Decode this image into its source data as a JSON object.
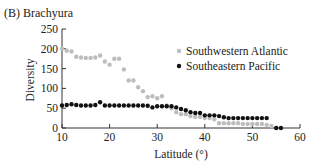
{
  "chart_data": {
    "type": "scatter",
    "title": "(B) Brachyura",
    "xlabel": "Latitude (°)",
    "ylabel": "Diversity",
    "xlim": [
      10,
      60
    ],
    "ylim": [
      0,
      250
    ],
    "xticks": [
      10,
      20,
      30,
      40,
      50,
      60
    ],
    "yticks": [
      0,
      50,
      100,
      150,
      200,
      250
    ],
    "grid": false,
    "legend_position": "upper right",
    "series": [
      {
        "name": "Southwestern Atlantic",
        "color": "#bdbdbd",
        "x": [
          10,
          11,
          12,
          13,
          14,
          15,
          16,
          17,
          18,
          19,
          20,
          21,
          22,
          23,
          24,
          25,
          26,
          27,
          28,
          29,
          30,
          31,
          32,
          33,
          34,
          35,
          36,
          37,
          38,
          39,
          40,
          41,
          42,
          43,
          44,
          45,
          46,
          47,
          48,
          49,
          50,
          51,
          52,
          53,
          54
        ],
        "y": [
          200,
          195,
          193,
          180,
          178,
          177,
          177,
          178,
          183,
          168,
          160,
          175,
          175,
          148,
          120,
          120,
          103,
          93,
          78,
          80,
          75,
          80,
          57,
          50,
          40,
          35,
          35,
          30,
          28,
          28,
          25,
          25,
          22,
          12,
          12,
          12,
          12,
          12,
          10,
          10,
          10,
          10,
          10,
          8,
          5
        ]
      },
      {
        "name": "Southeastern Pacific",
        "color": "#111111",
        "x": [
          10,
          11,
          12,
          13,
          14,
          15,
          16,
          17,
          18,
          19,
          20,
          21,
          22,
          23,
          24,
          25,
          26,
          27,
          28,
          29,
          30,
          31,
          32,
          33,
          34,
          35,
          36,
          37,
          38,
          39,
          40,
          41,
          42,
          43,
          44,
          45,
          46,
          47,
          48,
          49,
          50,
          51,
          52,
          53,
          55,
          56
        ],
        "y": [
          57,
          58,
          60,
          58,
          57,
          57,
          57,
          58,
          65,
          57,
          57,
          57,
          57,
          57,
          57,
          57,
          57,
          57,
          56,
          52,
          55,
          55,
          55,
          55,
          52,
          48,
          45,
          40,
          38,
          38,
          32,
          32,
          32,
          30,
          27,
          25,
          25,
          25,
          25,
          25,
          25,
          25,
          25,
          25,
          0,
          0
        ]
      }
    ]
  }
}
